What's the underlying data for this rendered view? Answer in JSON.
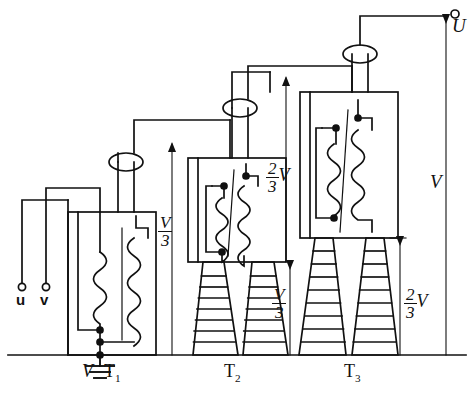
{
  "figure": {
    "kind": "cascade-transformer-schematic",
    "stroke_color": "#111111",
    "background_color": "#ffffff"
  },
  "terminals": {
    "input": [
      {
        "name": "u-terminal",
        "label": "u",
        "x": 22,
        "y": 292
      },
      {
        "name": "v-terminal",
        "label": "v",
        "x": 46,
        "y": 292
      }
    ],
    "output": {
      "name": "U-terminal",
      "label": "U",
      "x": 455,
      "y": 14
    }
  },
  "transformers": [
    {
      "id": "T1",
      "label": "T",
      "sub": "1",
      "label_x": 108,
      "label_y": 372
    },
    {
      "id": "T2",
      "label": "T",
      "sub": "2",
      "label_x": 228,
      "label_y": 372
    },
    {
      "id": "T3",
      "label": "T",
      "sub": "3",
      "label_x": 348,
      "label_y": 372
    }
  ],
  "ground": {
    "name": "earth-symbol",
    "label": "V",
    "label_x": 88,
    "label_y": 372
  },
  "dimensions": [
    {
      "name": "dim-v-over-3-stage1",
      "numerator": "V",
      "denominator": "3",
      "x": 163,
      "y": 228
    },
    {
      "name": "dim-2v-over-3-stage2",
      "numerator": "2",
      "denominator": "3",
      "suffix": "V",
      "x": 274,
      "y": 174
    },
    {
      "name": "dim-v-over-3-stage2-base",
      "numerator": "V",
      "denominator": "3",
      "x": 277,
      "y": 300
    },
    {
      "name": "dim-2v-over-3-stage3-base",
      "numerator": "2",
      "denominator": "3",
      "suffix": "V",
      "x": 411,
      "y": 300
    },
    {
      "name": "dim-v-total",
      "numerator": "V",
      "x": 436,
      "y": 182
    }
  ],
  "baseline": {
    "name": "ground-baseline",
    "y": 355,
    "x1": 8,
    "x2": 466
  }
}
